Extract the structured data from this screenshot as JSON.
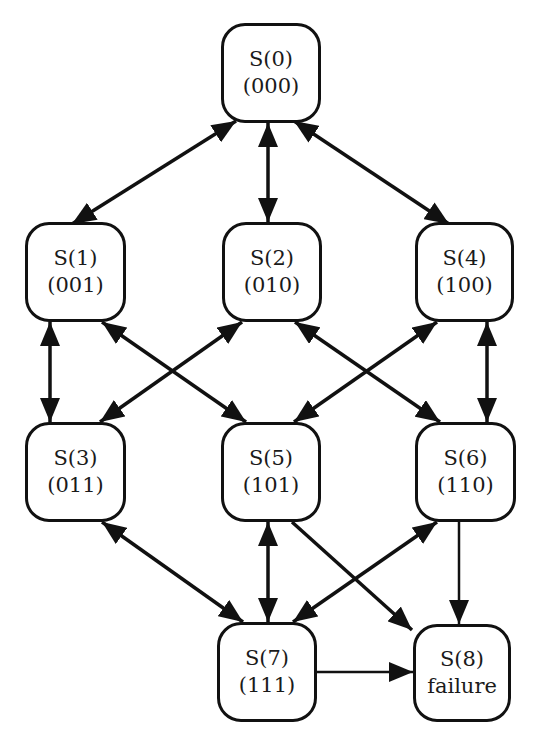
{
  "diagram": {
    "type": "state-transition-graph",
    "colors": {
      "stroke": "#111111",
      "background": "#ffffff",
      "text": "#1a1a1a"
    },
    "nodes": [
      {
        "id": "S0",
        "label": "S(0)",
        "sub": "(000)",
        "x": 221,
        "y": 23,
        "w": 100,
        "h": 100
      },
      {
        "id": "S1",
        "label": "S(1)",
        "sub": "(001)",
        "x": 25,
        "y": 222,
        "w": 101,
        "h": 100
      },
      {
        "id": "S2",
        "label": "S(2)",
        "sub": "(010)",
        "x": 222,
        "y": 222,
        "w": 100,
        "h": 100
      },
      {
        "id": "S4",
        "label": "S(4)",
        "sub": "(100)",
        "x": 415,
        "y": 222,
        "w": 99,
        "h": 100
      },
      {
        "id": "S3",
        "label": "S(3)",
        "sub": "(011)",
        "x": 25,
        "y": 422,
        "w": 101,
        "h": 100
      },
      {
        "id": "S5",
        "label": "S(5)",
        "sub": "(101)",
        "x": 221,
        "y": 422,
        "w": 100,
        "h": 100
      },
      {
        "id": "S6",
        "label": "S(6)",
        "sub": "(110)",
        "x": 415,
        "y": 422,
        "w": 101,
        "h": 100
      },
      {
        "id": "S7",
        "label": "S(7)",
        "sub": "(111)",
        "x": 217,
        "y": 622,
        "w": 100,
        "h": 100
      },
      {
        "id": "S8",
        "label": "S(8)",
        "sub": "failure",
        "x": 413,
        "y": 624,
        "w": 98,
        "h": 98
      }
    ],
    "edges": [
      {
        "from": "S0",
        "to": "S1",
        "bidirectional": true
      },
      {
        "from": "S0",
        "to": "S2",
        "bidirectional": true
      },
      {
        "from": "S0",
        "to": "S4",
        "bidirectional": true
      },
      {
        "from": "S1",
        "to": "S3",
        "bidirectional": true
      },
      {
        "from": "S1",
        "to": "S5",
        "bidirectional": true
      },
      {
        "from": "S2",
        "to": "S3",
        "bidirectional": true
      },
      {
        "from": "S2",
        "to": "S6",
        "bidirectional": true
      },
      {
        "from": "S4",
        "to": "S5",
        "bidirectional": true
      },
      {
        "from": "S4",
        "to": "S6",
        "bidirectional": true
      },
      {
        "from": "S3",
        "to": "S7",
        "bidirectional": true
      },
      {
        "from": "S5",
        "to": "S7",
        "bidirectional": true
      },
      {
        "from": "S6",
        "to": "S7",
        "bidirectional": true
      },
      {
        "from": "S5",
        "to": "S8",
        "bidirectional": false
      },
      {
        "from": "S6",
        "to": "S8",
        "bidirectional": false
      },
      {
        "from": "S7",
        "to": "S8",
        "bidirectional": false
      }
    ]
  }
}
